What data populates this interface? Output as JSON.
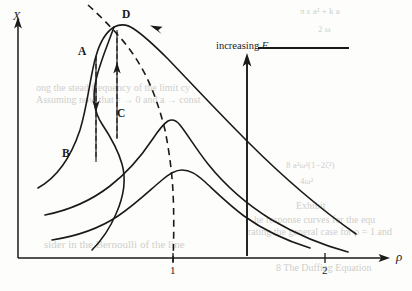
{
  "figure": {
    "kind": "frequency-response-curves",
    "background_color": "#fdfdfc",
    "ink_color": "#1a1a1a"
  },
  "axes": {
    "y_label": "X",
    "x_label": "ρ",
    "x_ticks": [
      {
        "label": "1",
        "x_px": 173
      },
      {
        "label": "2",
        "x_px": 325
      }
    ],
    "origin_px": {
      "x": 18,
      "y": 258
    },
    "y_top_px": 18,
    "x_right_px": 392
  },
  "annotations": {
    "increasing_f": {
      "text": "increasing ",
      "italic": "F"
    },
    "points": [
      {
        "label": "A",
        "x_px": 78,
        "y_px": 53
      },
      {
        "label": "B",
        "x_px": 62,
        "y_px": 155
      },
      {
        "label": "C",
        "x_px": 117,
        "y_px": 115
      },
      {
        "label": "D",
        "x_px": 120,
        "y_px": 16
      }
    ]
  },
  "chart_data": {
    "type": "line",
    "title": "",
    "xlabel": "ρ",
    "ylabel": "X",
    "grid": false,
    "legend": "none",
    "xlim": [
      0,
      2.55
    ],
    "ylim": [
      0,
      1.0
    ],
    "x_tick_values": [
      1,
      2
    ],
    "series": [
      {
        "name": "response-curve-large-F",
        "style": "solid",
        "description": "uppermost multivalued (S-shaped) response curve, peak at D",
        "note": "overhanging resonance curve with vertical tangency; jump points A and C"
      },
      {
        "name": "response-curve-medium-F",
        "style": "solid",
        "description": "middle response curve, peak just left of ρ = 1"
      },
      {
        "name": "response-curve-small-F",
        "style": "solid",
        "description": "lowest response curve, broad peak near ρ = 1"
      },
      {
        "name": "backbone",
        "style": "dashed",
        "description": "dashed backbone / locus of peak amplitudes, meets the ρ axis at ρ = 1"
      }
    ],
    "jumps": [
      {
        "name": "jump-down",
        "from": "A",
        "to": "B",
        "direction": "down"
      },
      {
        "name": "jump-up",
        "from": "C",
        "to": "D",
        "direction": "up"
      }
    ],
    "direction_arrow": {
      "name": "increasing-F",
      "direction": "up",
      "x_px": 247
    }
  },
  "bleed_text": [
    {
      "text": "π ε a² + k a",
      "x": 300,
      "y": 6,
      "size": 9
    },
    {
      "text": "2 ω",
      "x": 318,
      "y": 24,
      "size": 9
    },
    {
      "text": "ong the stead frequency of the limit cy",
      "x": 36,
      "y": 82,
      "size": 10
    },
    {
      "text": "Assuming now that  ε → 0  and  a → const",
      "x": 36,
      "y": 94,
      "size": 10
    },
    {
      "text": "8 a²ω²(1−2ζ²)",
      "x": 286,
      "y": 160,
      "size": 9
    },
    {
      "text": "4ω²",
      "x": 300,
      "y": 176,
      "size": 9
    },
    {
      "text": "Exhibit",
      "x": 296,
      "y": 200,
      "size": 10
    },
    {
      "text": "he response curves for the equ",
      "x": 254,
      "y": 214,
      "size": 10
    },
    {
      "text": "rating the general case for  ρ = 1 and",
      "x": 248,
      "y": 226,
      "size": 10
    },
    {
      "text": "8 The Duffing Equation",
      "x": 276,
      "y": 262,
      "size": 10
    },
    {
      "text": "sider in the Bernoulli  of  the  line",
      "x": 44,
      "y": 238,
      "size": 11
    }
  ]
}
